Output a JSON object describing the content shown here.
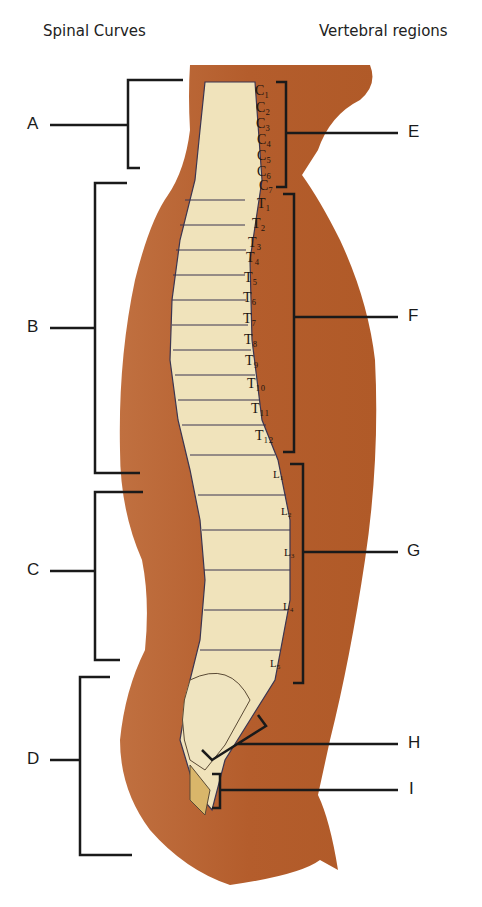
{
  "headers": {
    "left": "Spinal Curves",
    "right": "Vertebral regions"
  },
  "curve_labels": [
    {
      "id": "A",
      "y": 125,
      "top": 78,
      "bottom": 168
    },
    {
      "id": "B",
      "y": 328,
      "top": 183,
      "bottom": 473
    },
    {
      "id": "C",
      "y": 571,
      "top": 491,
      "bottom": 660
    },
    {
      "id": "D",
      "y": 760,
      "top": 675,
      "bottom": 855
    }
  ],
  "region_labels": [
    {
      "id": "E",
      "y": 133
    },
    {
      "id": "F",
      "y": 317
    },
    {
      "id": "G",
      "y": 552
    },
    {
      "id": "H",
      "y": 744
    },
    {
      "id": "I",
      "y": 790
    }
  ],
  "vertebrae": {
    "cervical": [
      "C1",
      "C2",
      "C3",
      "C4",
      "C5",
      "C6",
      "C7"
    ],
    "thoracic": [
      "T1",
      "T2",
      "T3",
      "T4",
      "T5",
      "T6",
      "T7",
      "T8",
      "T9",
      "T10",
      "T11",
      "T12"
    ],
    "lumbar": [
      "L1",
      "L2",
      "L3",
      "L4",
      "L5"
    ]
  },
  "colors": {
    "body": "#b5602e",
    "bone": "#f3e8c4",
    "line": "#1a1a1a"
  }
}
